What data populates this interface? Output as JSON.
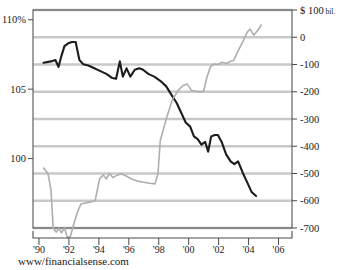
{
  "chart_data": {
    "type": "line",
    "title": "",
    "subtitle": "",
    "caption": "www/financialsense.com",
    "xlabel": "",
    "ylabel": "",
    "xlim": [
      1989.6,
      2006.9
    ],
    "x_ticks": [
      "'90",
      "'92",
      "'94",
      "'96",
      "'98",
      "'00",
      "'02",
      "'04",
      "'06"
    ],
    "x_tick_values": [
      1990,
      1992,
      1994,
      1996,
      1998,
      2000,
      2002,
      2004,
      2006
    ],
    "grid": true,
    "grid_orientation": "horizontal",
    "legend": "none",
    "axes": [
      {
        "id": "left",
        "side": "left",
        "unit": "%",
        "ylim": [
          95.0,
          110.7
        ],
        "ticks": [
          110,
          105,
          100
        ],
        "tick_labels": [
          "110%",
          "105",
          "100"
        ]
      },
      {
        "id": "right",
        "side": "right",
        "unit": "$ billions",
        "unit_label": "$ 100 bil.",
        "ylim": [
          -700,
          100
        ],
        "ticks": [
          100,
          0,
          -100,
          -200,
          -300,
          -400,
          -500,
          -600,
          -700
        ],
        "tick_labels": [
          "$ 100 bil.",
          "0",
          "-100",
          "-200",
          "-300",
          "-400",
          "-500",
          "-600",
          "-700"
        ]
      }
    ],
    "series": [
      {
        "name": "dollar-index",
        "axis": "left",
        "color": "#1c1c1c",
        "width": 2.1,
        "points": [
          [
            1990.3,
            106.9
          ],
          [
            1990.8,
            107.0
          ],
          [
            1991.1,
            107.1
          ],
          [
            1991.3,
            106.6
          ],
          [
            1991.5,
            107.4
          ],
          [
            1991.7,
            108.1
          ],
          [
            1991.95,
            108.3
          ],
          [
            1992.2,
            108.4
          ],
          [
            1992.45,
            108.4
          ],
          [
            1992.7,
            107.1
          ],
          [
            1992.95,
            106.8
          ],
          [
            1993.3,
            106.7
          ],
          [
            1993.7,
            106.5
          ],
          [
            1994.1,
            106.3
          ],
          [
            1994.5,
            106.1
          ],
          [
            1994.9,
            105.8
          ],
          [
            1995.15,
            105.75
          ],
          [
            1995.4,
            107.0
          ],
          [
            1995.6,
            105.9
          ],
          [
            1995.85,
            106.5
          ],
          [
            1996.1,
            105.9
          ],
          [
            1996.4,
            106.4
          ],
          [
            1996.7,
            106.5
          ],
          [
            1996.95,
            106.4
          ],
          [
            1997.3,
            106.1
          ],
          [
            1997.7,
            105.9
          ],
          [
            1998.1,
            105.6
          ],
          [
            1998.5,
            105.2
          ],
          [
            1998.9,
            104.5
          ],
          [
            1999.2,
            104.0
          ],
          [
            1999.5,
            103.3
          ],
          [
            1999.8,
            102.6
          ],
          [
            2000.1,
            102.3
          ],
          [
            2000.35,
            101.6
          ],
          [
            2000.6,
            101.4
          ],
          [
            2000.85,
            101.0
          ],
          [
            2001.1,
            101.2
          ],
          [
            2001.3,
            100.5
          ],
          [
            2001.5,
            101.6
          ],
          [
            2001.75,
            101.7
          ],
          [
            2001.95,
            101.7
          ],
          [
            2002.2,
            101.2
          ],
          [
            2002.5,
            100.3
          ],
          [
            2002.8,
            99.8
          ],
          [
            2003.05,
            99.6
          ],
          [
            2003.3,
            99.8
          ],
          [
            2003.6,
            99.0
          ],
          [
            2003.9,
            98.3
          ],
          [
            2004.2,
            97.6
          ],
          [
            2004.5,
            97.3
          ]
        ]
      },
      {
        "name": "trade-deficit",
        "axis": "right",
        "color": "#aeaeae",
        "width": 1.6,
        "points": [
          [
            1990.3,
            -480
          ],
          [
            1990.6,
            -500
          ],
          [
            1990.8,
            -560
          ],
          [
            1990.95,
            -700
          ],
          [
            1991.15,
            -715
          ],
          [
            1991.35,
            -700
          ],
          [
            1991.5,
            -718
          ],
          [
            1991.7,
            -700
          ],
          [
            1991.9,
            -735
          ],
          [
            1992.1,
            -730
          ],
          [
            1992.3,
            -690
          ],
          [
            1992.55,
            -645
          ],
          [
            1992.8,
            -612
          ],
          [
            1993.1,
            -608
          ],
          [
            1993.4,
            -605
          ],
          [
            1993.75,
            -600
          ],
          [
            1994.05,
            -520
          ],
          [
            1994.3,
            -505
          ],
          [
            1994.5,
            -520
          ],
          [
            1994.7,
            -500
          ],
          [
            1994.95,
            -515
          ],
          [
            1995.25,
            -505
          ],
          [
            1995.55,
            -502
          ],
          [
            1995.85,
            -510
          ],
          [
            1996.2,
            -520
          ],
          [
            1996.6,
            -528
          ],
          [
            1997.0,
            -532
          ],
          [
            1997.4,
            -536
          ],
          [
            1997.75,
            -538
          ],
          [
            1997.95,
            -500
          ],
          [
            1998.1,
            -380
          ],
          [
            1998.5,
            -300
          ],
          [
            1998.9,
            -230
          ],
          [
            1999.3,
            -195
          ],
          [
            1999.6,
            -178
          ],
          [
            1999.9,
            -172
          ],
          [
            2000.2,
            -196
          ],
          [
            2000.5,
            -198
          ],
          [
            2000.8,
            -200
          ],
          [
            2001.0,
            -198
          ],
          [
            2001.2,
            -150
          ],
          [
            2001.45,
            -108
          ],
          [
            2001.7,
            -98
          ],
          [
            2001.95,
            -100
          ],
          [
            2002.2,
            -92
          ],
          [
            2002.5,
            -96
          ],
          [
            2002.8,
            -88
          ],
          [
            2003.0,
            -85
          ],
          [
            2003.3,
            -50
          ],
          [
            2003.6,
            -18
          ],
          [
            2003.9,
            18
          ],
          [
            2004.1,
            30
          ],
          [
            2004.35,
            8
          ],
          [
            2004.6,
            24
          ],
          [
            2004.85,
            45
          ]
        ]
      }
    ]
  },
  "plot": {
    "left": 33,
    "top": 10,
    "right": 292,
    "bottom": 228,
    "xaxis_rule_y": 238,
    "xaxis_tick_len": 7,
    "xaxis_label_y": 251,
    "caption_x": 18,
    "caption_y": 265
  }
}
